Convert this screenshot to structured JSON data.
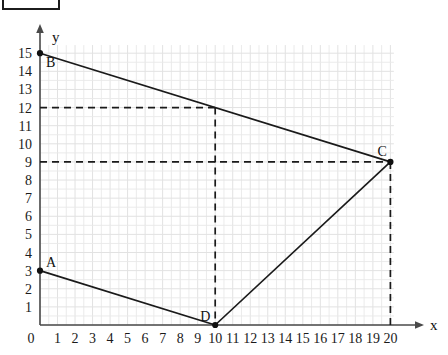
{
  "figure": {
    "kind": "coordinate-grid-diagram",
    "background_color": "#ffffff",
    "axis_color": "#4a4a4a",
    "grid_color": "#e9e9e9",
    "line_color": "#1a1a1a"
  },
  "axes": {
    "x_axis_label": "x",
    "y_axis_label": "y",
    "origin_label": "0",
    "x_ticks": [
      "1",
      "2",
      "3",
      "4",
      "5",
      "6",
      "7",
      "8",
      "9",
      "10",
      "11",
      "12",
      "13",
      "14",
      "15",
      "16",
      "17",
      "18",
      "19",
      "20"
    ],
    "y_ticks": [
      "1",
      "2",
      "3",
      "4",
      "5",
      "6",
      "7",
      "8",
      "9",
      "10",
      "11",
      "12",
      "13",
      "14",
      "15"
    ]
  },
  "points": {
    "A": {
      "label": "A",
      "x": 0,
      "y": 3
    },
    "B": {
      "label": "B",
      "x": 0,
      "y": 15
    },
    "C": {
      "label": "C",
      "x": 20,
      "y": 9
    },
    "D": {
      "label": "D",
      "x": 10,
      "y": 0
    }
  },
  "chart_data": {
    "type": "line",
    "title": "",
    "xlabel": "x",
    "ylabel": "y",
    "xlim": [
      0,
      20
    ],
    "ylim": [
      0,
      15
    ],
    "grid": true,
    "legend": "none",
    "x_tick_values": [
      0,
      1,
      2,
      3,
      4,
      5,
      6,
      7,
      8,
      9,
      10,
      11,
      12,
      13,
      14,
      15,
      16,
      17,
      18,
      19,
      20
    ],
    "y_tick_values": [
      0,
      1,
      2,
      3,
      4,
      5,
      6,
      7,
      8,
      9,
      10,
      11,
      12,
      13,
      14,
      15
    ],
    "annotations": [
      {
        "text": "A",
        "x": 0,
        "y": 3
      },
      {
        "text": "B",
        "x": 0,
        "y": 15
      },
      {
        "text": "C",
        "x": 20,
        "y": 9
      },
      {
        "text": "D",
        "x": 10,
        "y": 0
      }
    ],
    "series": [
      {
        "name": "BC",
        "style": "solid",
        "points": [
          [
            0,
            15
          ],
          [
            20,
            9
          ]
        ]
      },
      {
        "name": "AD",
        "style": "solid",
        "points": [
          [
            0,
            3
          ],
          [
            10,
            0
          ]
        ]
      },
      {
        "name": "DC",
        "style": "solid",
        "points": [
          [
            10,
            0
          ],
          [
            20,
            9
          ]
        ]
      },
      {
        "name": "guide-horizontal-12",
        "style": "dashed",
        "points": [
          [
            0,
            12
          ],
          [
            10,
            12
          ]
        ]
      },
      {
        "name": "guide-horizontal-9",
        "style": "dashed",
        "points": [
          [
            0,
            9
          ],
          [
            20,
            9
          ]
        ]
      },
      {
        "name": "guide-vertical-x10",
        "style": "dashed",
        "points": [
          [
            10,
            12
          ],
          [
            10,
            0
          ]
        ]
      },
      {
        "name": "guide-vertical-x20",
        "style": "dashed",
        "points": [
          [
            20,
            9
          ],
          [
            20,
            0
          ]
        ]
      }
    ],
    "markers": [
      {
        "label": "B",
        "x": 0,
        "y": 15
      },
      {
        "label": "A",
        "x": 0,
        "y": 3
      },
      {
        "label": "C",
        "x": 20,
        "y": 9
      },
      {
        "label": "D",
        "x": 10,
        "y": 0
      }
    ]
  }
}
